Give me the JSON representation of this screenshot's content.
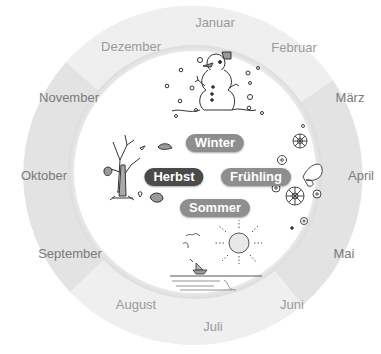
{
  "diagram": {
    "colors": {
      "ring_light": "#eeeeee",
      "ring_dark": "#e2e2e2",
      "inner_disc": "#ffffff",
      "pill_default": "#8e8e8e",
      "pill_active": "#4a4a4a",
      "month_text": "#7a7a7a"
    },
    "seasons": [
      {
        "id": "winter",
        "label": "Winter",
        "active": false,
        "icon": "snowman-icon"
      },
      {
        "id": "herbst",
        "label": "Herbst",
        "active": true,
        "icon": "bare-tree-icon"
      },
      {
        "id": "fruehling",
        "label": "Frühling",
        "active": false,
        "icon": "flowers-butterfly-icon"
      },
      {
        "id": "sommer",
        "label": "Sommer",
        "active": false,
        "icon": "sun-sailboat-icon"
      }
    ],
    "months": [
      {
        "label": "Januar",
        "season": "winter"
      },
      {
        "label": "Februar",
        "season": "winter"
      },
      {
        "label": "März",
        "season": "fruehling"
      },
      {
        "label": "April",
        "season": "fruehling"
      },
      {
        "label": "Mai",
        "season": "fruehling"
      },
      {
        "label": "Juni",
        "season": "sommer"
      },
      {
        "label": "Juli",
        "season": "sommer"
      },
      {
        "label": "August",
        "season": "sommer"
      },
      {
        "label": "September",
        "season": "herbst"
      },
      {
        "label": "Oktober",
        "season": "herbst"
      },
      {
        "label": "November",
        "season": "herbst"
      },
      {
        "label": "Dezember",
        "season": "winter"
      }
    ]
  }
}
